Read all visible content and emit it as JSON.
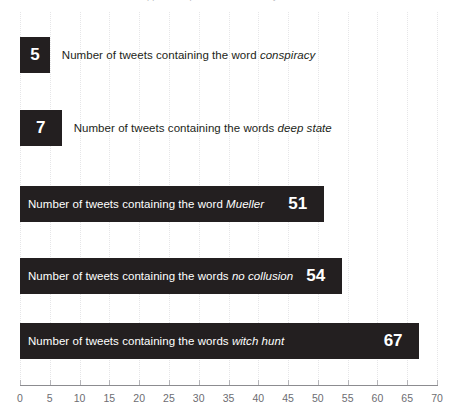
{
  "clipped_header": {
    "text": "Robert Mueller  was appointed special counsel in May of 2017 and has..."
  },
  "chart_data": {
    "type": "bar",
    "orientation": "horizontal",
    "title": "",
    "xlabel": "",
    "ylabel": "",
    "xlim": [
      0,
      70
    ],
    "xticks": [
      0,
      5,
      10,
      15,
      20,
      25,
      30,
      35,
      40,
      45,
      50,
      55,
      60,
      65,
      70
    ],
    "grid": true,
    "legend": false,
    "bar_color": "#231f20",
    "categories": [
      "Number of tweets containing the word conspiracy",
      "Number of tweets containing the words deep state",
      "Number of tweets containing the word Mueller",
      "Number of tweets containing the words no collusion",
      "Number of tweets containing the words witch hunt"
    ],
    "values": [
      5,
      7,
      51,
      54,
      67
    ],
    "bars": [
      {
        "value": 5,
        "value_label": "5",
        "label_prefix": "Number of tweets containing the word ",
        "label_term": "conspiracy",
        "label_position": "outside"
      },
      {
        "value": 7,
        "value_label": "7",
        "label_prefix": "Number of tweets containing the words ",
        "label_term": "deep state",
        "label_position": "outside"
      },
      {
        "value": 51,
        "value_label": "51",
        "label_prefix": "Number of tweets containing the word ",
        "label_term": "Mueller",
        "label_position": "inside"
      },
      {
        "value": 54,
        "value_label": "54",
        "label_prefix": "Number of tweets containing the words ",
        "label_term": "no collusion",
        "label_position": "inside"
      },
      {
        "value": 67,
        "value_label": "67",
        "label_prefix": "Number of tweets containing the words ",
        "label_term": "witch hunt",
        "label_position": "inside"
      }
    ]
  }
}
